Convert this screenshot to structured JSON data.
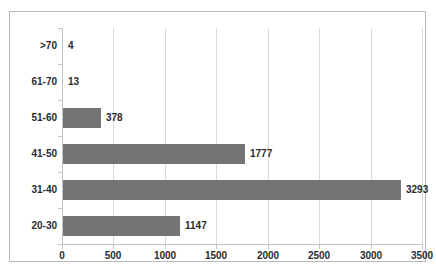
{
  "chart_data": {
    "type": "bar",
    "orientation": "horizontal",
    "title": "",
    "xlabel": "",
    "ylabel": "",
    "categories": [
      "20-30",
      "31-40",
      "41-50",
      "51-60",
      "61-70",
      ">70"
    ],
    "values": [
      1147,
      3293,
      1777,
      378,
      13,
      4
    ],
    "data_labels": [
      "1147",
      "3293",
      "1777",
      "378",
      "13",
      "4"
    ],
    "xlim": [
      0,
      3500
    ],
    "xticks": [
      0,
      500,
      1000,
      1500,
      2000,
      2500,
      3000,
      3500
    ],
    "xtick_labels": [
      "0",
      "500",
      "1000",
      "1500",
      "2000",
      "2500",
      "3000",
      "3500"
    ],
    "grid": "vertical",
    "legend": "none",
    "series": [
      {
        "name": "Count",
        "color": "#757575",
        "values": [
          1147,
          3293,
          1777,
          378,
          13,
          4
        ]
      }
    ],
    "colors": {
      "bar": "#757575",
      "gridline": "#d9d9d9",
      "axis": "#c4c4c4",
      "text": "#2b2b2b",
      "frame": "#b8b8b8",
      "background": "#ffffff"
    }
  }
}
